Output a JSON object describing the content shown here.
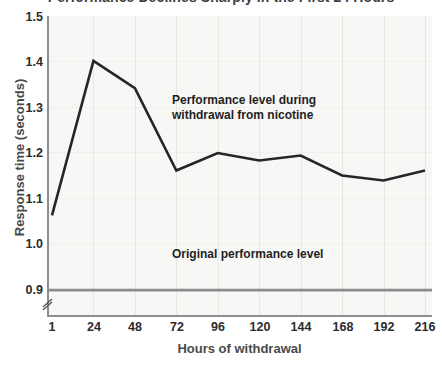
{
  "chart_data": {
    "type": "line",
    "title": "Performance Declines Sharply in the First 24 Hours",
    "xlabel": "Hours of withdrawal",
    "ylabel": "Response time (seconds)",
    "x": [
      1,
      24,
      48,
      72,
      96,
      120,
      144,
      168,
      192,
      216
    ],
    "xtick_labels": [
      "1",
      "24",
      "48",
      "72",
      "96",
      "120",
      "144",
      "168",
      "192",
      "216"
    ],
    "ytick_labels": [
      "1.5",
      "1.4",
      "1.3",
      "1.2",
      "1.1",
      "1.0",
      "0.9"
    ],
    "ytick_values": [
      1.5,
      1.4,
      1.3,
      1.2,
      1.1,
      1.0,
      0.9
    ],
    "ylim": [
      0.9,
      1.5
    ],
    "y_axis_broken": true,
    "grid": true,
    "legend_position": "inline-annotation",
    "series": [
      {
        "name": "Performance level during withdrawal from nicotine",
        "type": "line",
        "color": "#262626",
        "values": [
          1.1,
          1.41,
          1.355,
          1.19,
          1.225,
          1.21,
          1.22,
          1.18,
          1.17,
          1.19
        ]
      },
      {
        "name": "Original performance level",
        "type": "hline",
        "color": "#8c8c8c",
        "value": 0.95
      }
    ],
    "annotations": [
      {
        "id": "series-annotation",
        "text": "Performance level during\nwithdrawal from nicotine"
      },
      {
        "id": "baseline-annotation",
        "text": "Original performance level"
      }
    ]
  }
}
